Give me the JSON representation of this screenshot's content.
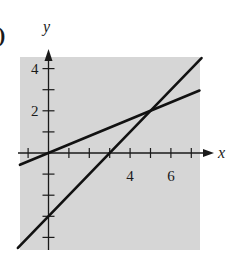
{
  "panel_label": ")",
  "chart_data": {
    "type": "line",
    "title": "",
    "xlabel": "x",
    "ylabel": "y",
    "xlim": [
      -1.4,
      7.4
    ],
    "ylim": [
      -4.5,
      4.6
    ],
    "x_ticks": [
      -1,
      1,
      2,
      3,
      4,
      5,
      6,
      7
    ],
    "x_tick_labels": [
      {
        "value": 4,
        "label": "4"
      },
      {
        "value": 6,
        "label": "6"
      }
    ],
    "y_ticks": [
      -4,
      -3,
      -2,
      -1,
      1,
      2,
      3,
      4
    ],
    "y_tick_labels": [
      {
        "value": 2,
        "label": "2"
      },
      {
        "value": 4,
        "label": "4"
      }
    ],
    "grid": false,
    "background": "#d6d6d6",
    "line_color": "#111111",
    "series": [
      {
        "name": "y = 0.4x",
        "x": [
          -1.4,
          7.4
        ],
        "y": [
          -0.56,
          2.96
        ]
      },
      {
        "name": "y = x - 3",
        "x": [
          -1.5,
          7.5
        ],
        "y": [
          -4.5,
          4.5
        ]
      }
    ],
    "annotations": [
      {
        "type": "intersection",
        "x": 5,
        "y": 2
      }
    ]
  }
}
